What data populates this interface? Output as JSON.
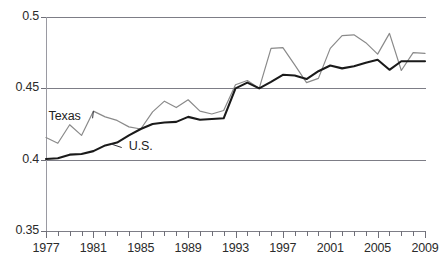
{
  "chart_data": {
    "type": "line",
    "title": "",
    "subtitle": "",
    "xlabel": "",
    "ylabel": "",
    "xlim": [
      1977,
      2009
    ],
    "ylim": [
      0.35,
      0.5
    ],
    "yticks": [
      0.35,
      0.4,
      0.45,
      0.5
    ],
    "ytick_labels": [
      "0.35",
      "0.4",
      "0.45",
      "0.5"
    ],
    "xticks": [
      1977,
      1978,
      1979,
      1980,
      1981,
      1982,
      1983,
      1984,
      1985,
      1986,
      1987,
      1988,
      1989,
      1990,
      1991,
      1992,
      1993,
      1994,
      1995,
      1996,
      1997,
      1998,
      1999,
      2000,
      2001,
      2002,
      2003,
      2004,
      2005,
      2006,
      2007,
      2008,
      2009
    ],
    "xtick_labels": [
      "1977",
      "1981",
      "1985",
      "1989",
      "1993",
      "1997",
      "2001",
      "2005",
      "2009"
    ],
    "xtick_labeled_years": [
      1977,
      1981,
      1985,
      1989,
      1993,
      1997,
      2001,
      2005,
      2009
    ],
    "grid": true,
    "grid_axis": "y",
    "legend": "inline-annotations",
    "x": [
      1977,
      1978,
      1979,
      1980,
      1981,
      1982,
      1983,
      1984,
      1985,
      1986,
      1987,
      1988,
      1989,
      1990,
      1991,
      1992,
      1993,
      1994,
      1995,
      1996,
      1997,
      1998,
      1999,
      2000,
      2001,
      2002,
      2003,
      2004,
      2005,
      2006,
      2007,
      2008,
      2009
    ],
    "series": [
      {
        "name": "Texas",
        "color": "#8a8a8a",
        "width": 1.2,
        "values": [
          0.4155,
          0.4115,
          0.4245,
          0.417,
          0.434,
          0.43,
          0.4275,
          0.423,
          0.4215,
          0.4335,
          0.441,
          0.4365,
          0.442,
          0.434,
          0.432,
          0.4345,
          0.4525,
          0.4555,
          0.45,
          0.478,
          0.4785,
          0.4665,
          0.454,
          0.457,
          0.478,
          0.487,
          0.4875,
          0.482,
          0.474,
          0.4885,
          0.4625,
          0.475,
          0.4745
        ]
      },
      {
        "name": "U.S.",
        "color": "#1a1a1a",
        "width": 2.1,
        "values": [
          0.4005,
          0.401,
          0.4035,
          0.404,
          0.406,
          0.41,
          0.412,
          0.417,
          0.4215,
          0.425,
          0.426,
          0.4265,
          0.43,
          0.428,
          0.4285,
          0.429,
          0.45,
          0.454,
          0.45,
          0.4545,
          0.4595,
          0.459,
          0.4565,
          0.462,
          0.466,
          0.464,
          0.4655,
          0.468,
          0.47,
          0.463,
          0.469,
          0.469,
          0.469
        ]
      }
    ],
    "annotations": [
      {
        "text": "Texas",
        "x_year": 1978.4,
        "y_value": 0.429,
        "leader_to_x": 1981.0,
        "leader_to_y": 0.434
      },
      {
        "text": "U.S.",
        "x_year": 1983.9,
        "y_value": 0.4085,
        "leader_to_x": 1982.5,
        "leader_to_y": 0.411
      }
    ]
  },
  "axis": {
    "y_labels": [
      "0.5",
      "0.45",
      "0.4",
      "0.35"
    ],
    "x_labels": [
      "1977",
      "1981",
      "1985",
      "1989",
      "1993",
      "1997",
      "2001",
      "2005",
      "2009"
    ]
  },
  "labels": {
    "texas": "Texas",
    "us": "U.S."
  }
}
